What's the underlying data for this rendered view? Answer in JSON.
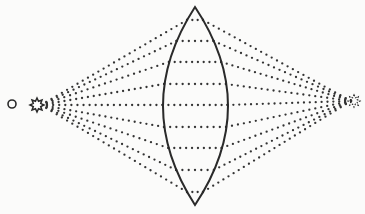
{
  "diagram": {
    "title": "",
    "colors": {
      "background": "#fbfbfa",
      "ink": "#2a2a2a",
      "dots": "#333333"
    },
    "source": {
      "x": 37,
      "y": 105,
      "shape": "star-icon",
      "label": ""
    },
    "observer_circle": {
      "x": 12,
      "y": 104,
      "r": 4
    },
    "image_point": {
      "x": 354,
      "y": 101,
      "shape": "star-icon",
      "label": ""
    },
    "lens": {
      "top": {
        "x": 195,
        "y": 7
      },
      "bottom": {
        "x": 195,
        "y": 205
      },
      "left_x": 163,
      "right_x": 228
    },
    "rays_y": [
      20,
      41,
      62,
      84,
      105,
      127,
      148,
      170,
      192
    ],
    "dot_spacing": 6
  }
}
